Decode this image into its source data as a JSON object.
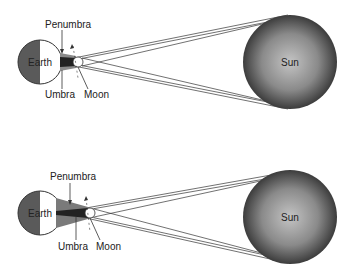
{
  "diagrams": [
    {
      "name": "top",
      "labels": {
        "penumbra": "Penumbra",
        "umbra": "Umbra",
        "moon": "Moon",
        "earth": "Earth",
        "sun": "Sun"
      }
    },
    {
      "name": "bottom",
      "labels": {
        "penumbra": "Penumbra",
        "umbra": "Umbra",
        "moon": "Moon",
        "earth": "Earth",
        "sun": "Sun"
      }
    }
  ],
  "colors": {
    "earth_dark": "#5a5a5a",
    "shadow_umbra": "#2a2a2a",
    "shadow_penumbra": "#7a7a7a",
    "sun_edge": "#3a3a3a",
    "sun_center": "#bdbdbd",
    "line": "#333333"
  }
}
